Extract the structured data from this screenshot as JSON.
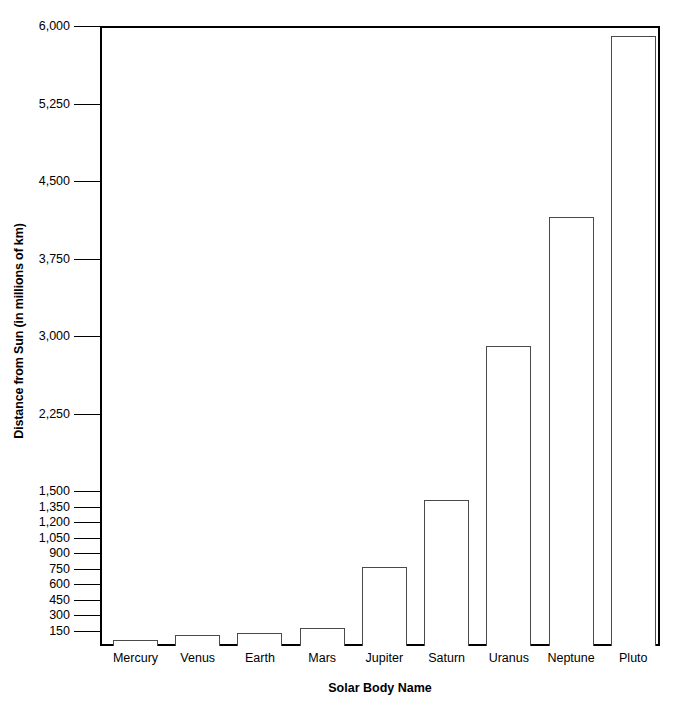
{
  "chart_data": {
    "type": "bar",
    "title": "",
    "xlabel": "Solar Body Name",
    "ylabel": "Distance from Sun (in millions of km)",
    "categories": [
      "Mercury",
      "Venus",
      "Earth",
      "Mars",
      "Jupiter",
      "Saturn",
      "Uranus",
      "Neptune",
      "Pluto"
    ],
    "values": [
      58,
      108,
      128,
      175,
      765,
      1413,
      2900,
      4150,
      5900
    ],
    "ylim": [
      0,
      6000
    ],
    "ytick_labels": [
      "150",
      "300",
      "450",
      "600",
      "750",
      "900",
      "1,050",
      "1,200",
      "1,350",
      "1,500",
      "2,250",
      "3,000",
      "3,750",
      "4,500",
      "5,250",
      "6,000"
    ],
    "ytick_values": [
      150,
      300,
      450,
      600,
      750,
      900,
      1050,
      1200,
      1350,
      1500,
      2250,
      3000,
      3750,
      4500,
      5250,
      6000
    ],
    "grid": false,
    "legend": false,
    "bar_fill_color": "#ffffff",
    "bar_border_color": "#4a4a4a",
    "axis_color": "#000000"
  }
}
